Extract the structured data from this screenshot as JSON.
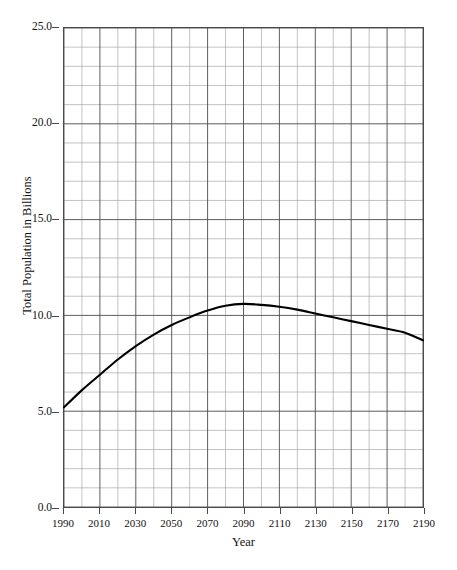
{
  "chart_data": {
    "type": "line",
    "title": "",
    "xlabel": "Year",
    "ylabel": "Total Population in Billions",
    "xlim": [
      1990,
      2190
    ],
    "ylim": [
      0.0,
      25.0
    ],
    "grid": true,
    "legend": "none",
    "x_major_step": 20,
    "x_minor_step": 10,
    "y_major_step": 5.0,
    "y_minor_step": 1.0,
    "x_tick_labels": [
      "1990",
      "2010",
      "2030",
      "2050",
      "2070",
      "2090",
      "2110",
      "2130",
      "2150",
      "2170",
      "2190"
    ],
    "y_tick_labels": [
      "25.0",
      "20.0",
      "15.0",
      "10.0",
      "5.0",
      "0.0"
    ],
    "series": [
      {
        "name": "Total Population",
        "color": "#000000",
        "x": [
          1990,
          2000,
          2010,
          2020,
          2030,
          2040,
          2050,
          2060,
          2070,
          2080,
          2090,
          2100,
          2110,
          2120,
          2130,
          2140,
          2150,
          2160,
          2170,
          2180,
          2190
        ],
        "values": [
          5.2,
          6.1,
          6.9,
          7.7,
          8.4,
          9.0,
          9.5,
          9.9,
          10.25,
          10.5,
          10.6,
          10.55,
          10.45,
          10.3,
          10.1,
          9.9,
          9.7,
          9.5,
          9.3,
          9.1,
          8.7
        ]
      }
    ]
  },
  "axis": {
    "y_title": "Total Population in Billions",
    "x_title": "Year"
  },
  "header": {
    "clipped_title": "·"
  }
}
